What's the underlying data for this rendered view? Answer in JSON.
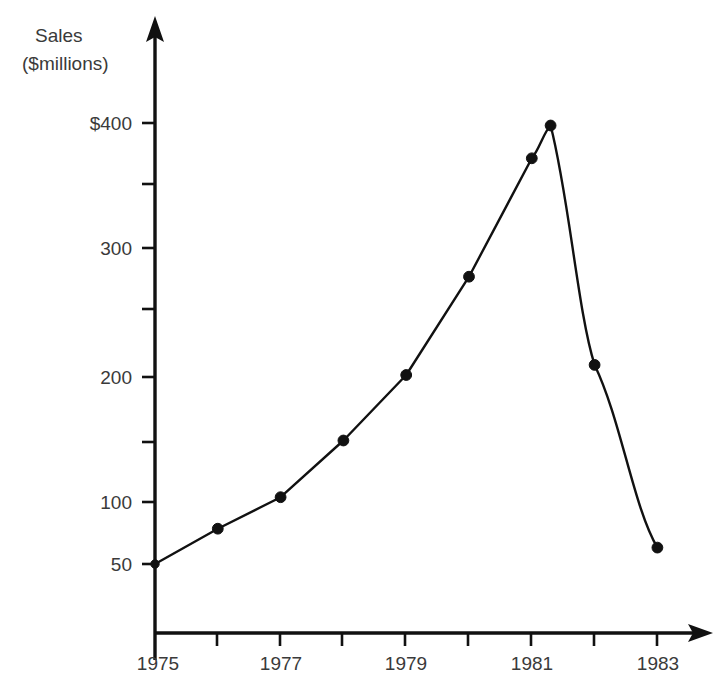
{
  "chart_data": {
    "type": "line",
    "title": "",
    "subtitle": "",
    "ylabel_lines": [
      "Sales",
      "($millions)"
    ],
    "ylabel": "Sales ($millions)",
    "xlabel": "",
    "x": [
      1975,
      1976,
      1977,
      1978,
      1979,
      1980,
      1981,
      1981.3,
      1982,
      1983
    ],
    "values": [
      50,
      78,
      103,
      148,
      200,
      278,
      372,
      398,
      208,
      63
    ],
    "series": [
      {
        "name": "Sales",
        "points": [
          {
            "x": 1975,
            "y": 50
          },
          {
            "x": 1976,
            "y": 78
          },
          {
            "x": 1977,
            "y": 103
          },
          {
            "x": 1978,
            "y": 148
          },
          {
            "x": 1979,
            "y": 200
          },
          {
            "x": 1980,
            "y": 278
          },
          {
            "x": 1981,
            "y": 372
          },
          {
            "x": 1981.3,
            "y": 398
          },
          {
            "x": 1982,
            "y": 208
          },
          {
            "x": 1983,
            "y": 63
          }
        ]
      }
    ],
    "xlim": [
      1975,
      1983.6
    ],
    "ylim": [
      50,
      420
    ],
    "grid": false,
    "legend": false,
    "legend_position": "none",
    "marker_style": "filled-circle",
    "y_ticks": [
      {
        "value": 400,
        "label": "$400",
        "major": true
      },
      {
        "value": 350,
        "label": "",
        "major": false
      },
      {
        "value": 300,
        "label": "300",
        "major": true
      },
      {
        "value": 250,
        "label": "",
        "major": false
      },
      {
        "value": 200,
        "label": "200",
        "major": true
      },
      {
        "value": 150,
        "label": "",
        "major": false
      },
      {
        "value": 100,
        "label": "100",
        "major": true
      },
      {
        "value": 50,
        "label": "50",
        "major": true
      }
    ],
    "x_ticks": [
      {
        "value": 1975,
        "label": "1975",
        "major": true
      },
      {
        "value": 1976,
        "label": "",
        "major": false
      },
      {
        "value": 1977,
        "label": "1977",
        "major": true
      },
      {
        "value": 1978,
        "label": "",
        "major": false
      },
      {
        "value": 1979,
        "label": "1979",
        "major": true
      },
      {
        "value": 1980,
        "label": "",
        "major": false
      },
      {
        "value": 1981,
        "label": "1981",
        "major": true
      },
      {
        "value": 1982,
        "label": "",
        "major": false
      },
      {
        "value": 1983,
        "label": "1983",
        "major": true
      }
    ],
    "colors": {
      "line": "#111111",
      "marker": "#111111",
      "axis": "#111111",
      "label": "#3a3a3a",
      "background": "#ffffff"
    }
  },
  "axis_titles": {
    "y_line1": "Sales",
    "y_line2": "($millions)"
  },
  "y_tick_labels": {
    "t400": "$400",
    "t300": "300",
    "t200": "200",
    "t100": "100",
    "t50": "50"
  },
  "x_tick_labels": {
    "t1975": "1975",
    "t1977": "1977",
    "t1979": "1979",
    "t1981": "1981",
    "t1983": "1983"
  }
}
